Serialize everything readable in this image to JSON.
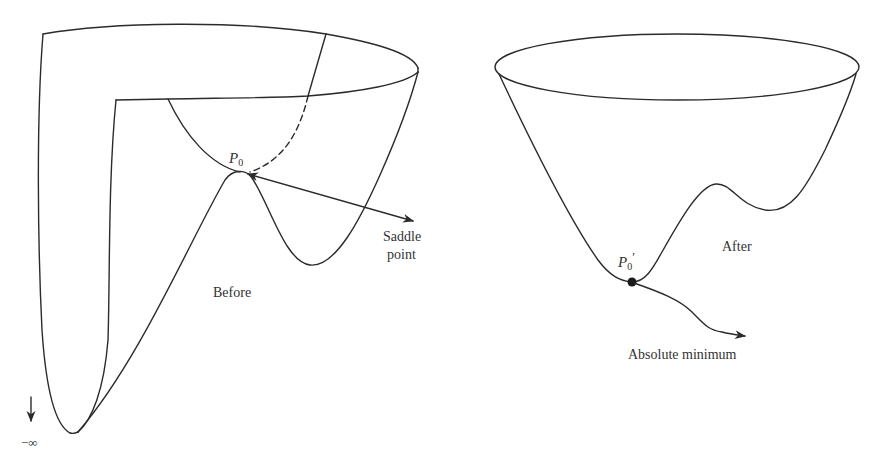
{
  "figure": {
    "left_panel": {
      "caption": "Before",
      "point_label": "P",
      "point_subscript": "0",
      "annotation_line1": "Saddle",
      "annotation_line2": "point",
      "limit_label": "−∞"
    },
    "right_panel": {
      "caption": "After",
      "point_label": "P",
      "point_subscript": "0",
      "point_prime": "′",
      "annotation": "Absolute minimum"
    },
    "colors": {
      "line": "#2b2b2b",
      "text": "#333333",
      "background": "#ffffff"
    }
  }
}
